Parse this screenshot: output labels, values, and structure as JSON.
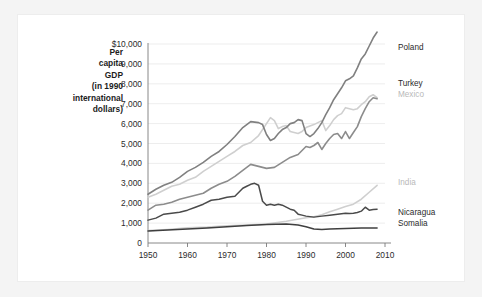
{
  "axis_title_lines": [
    "Per",
    "capita",
    "GDP",
    "(in 1990",
    "international",
    "dollars)"
  ],
  "chart_data": {
    "type": "line",
    "title": "",
    "subtitle": "",
    "xlabel": "",
    "ylabel": "Per capita GDP (in 1990 international dollars)",
    "xlim": [
      1950,
      2010
    ],
    "ylim": [
      0,
      10000
    ],
    "grid": true,
    "legend_position": "right-inline-labels",
    "ytick_labels": [
      "$10,000",
      "9,000",
      "8,000",
      "7,000",
      "6,000",
      "5,000",
      "4,000",
      "3,000",
      "2,000",
      "1,000",
      "0"
    ],
    "ytick_values": [
      10000,
      9000,
      8000,
      7000,
      6000,
      5000,
      4000,
      3000,
      2000,
      1000,
      0
    ],
    "xtick_labels": [
      "1950",
      "1960",
      "1970",
      "1980",
      "1990",
      "2000",
      "2010"
    ],
    "xtick_values": [
      1950,
      1960,
      1970,
      1980,
      1990,
      2000,
      2010
    ],
    "series": [
      {
        "name": "Poland",
        "color": "#808080",
        "width": 1.6,
        "label_y_value": 9850,
        "x": [
          1950,
          1952,
          1954,
          1956,
          1958,
          1960,
          1962,
          1964,
          1966,
          1968,
          1970,
          1972,
          1974,
          1976,
          1978,
          1979,
          1980,
          1981,
          1982,
          1983,
          1984,
          1985,
          1986,
          1987,
          1988,
          1989,
          1990,
          1991,
          1992,
          1993,
          1994,
          1995,
          1996,
          1997,
          1998,
          1999,
          2000,
          2001,
          2002,
          2003,
          2004,
          2005,
          2006,
          2007,
          2008
        ],
        "values": [
          2450,
          2700,
          2900,
          3050,
          3300,
          3600,
          3800,
          4050,
          4350,
          4600,
          4950,
          5350,
          5800,
          6100,
          6050,
          5950,
          5450,
          5150,
          5250,
          5500,
          5700,
          5800,
          6000,
          6050,
          6200,
          6150,
          5500,
          5350,
          5500,
          5750,
          6050,
          6450,
          6800,
          7200,
          7500,
          7800,
          8150,
          8250,
          8400,
          8800,
          9250,
          9500,
          9900,
          10300,
          10600
        ]
      },
      {
        "name": "Turkey",
        "color": "#8c8c8c",
        "width": 1.6,
        "label_y_value": 8050,
        "x": [
          1950,
          1952,
          1954,
          1956,
          1958,
          1960,
          1962,
          1964,
          1966,
          1968,
          1970,
          1972,
          1974,
          1976,
          1978,
          1980,
          1982,
          1984,
          1986,
          1988,
          1990,
          1991,
          1992,
          1993,
          1994,
          1995,
          1996,
          1997,
          1998,
          1999,
          2000,
          2001,
          2002,
          2003,
          2004,
          2005,
          2006,
          2007,
          2008
        ],
        "values": [
          1650,
          1900,
          1950,
          2050,
          2200,
          2300,
          2400,
          2500,
          2750,
          2950,
          3100,
          3350,
          3650,
          3950,
          3850,
          3750,
          3800,
          4050,
          4300,
          4450,
          4850,
          4800,
          4900,
          5050,
          4700,
          5000,
          5250,
          5450,
          5500,
          5250,
          5600,
          5250,
          5550,
          5850,
          6350,
          6750,
          7100,
          7300,
          7250
        ]
      },
      {
        "name": "Mexico",
        "color": "#cfcfcf",
        "width": 1.6,
        "label_y_value": 7500,
        "x": [
          1950,
          1952,
          1954,
          1956,
          1958,
          1960,
          1962,
          1964,
          1966,
          1968,
          1970,
          1972,
          1974,
          1976,
          1978,
          1980,
          1981,
          1982,
          1983,
          1984,
          1985,
          1986,
          1987,
          1988,
          1989,
          1990,
          1992,
          1994,
          1995,
          1996,
          1997,
          1998,
          1999,
          2000,
          2001,
          2002,
          2003,
          2004,
          2005,
          2006,
          2007,
          2008
        ],
        "values": [
          2300,
          2450,
          2650,
          2850,
          2950,
          3150,
          3300,
          3600,
          3850,
          4100,
          4350,
          4600,
          4900,
          5050,
          5400,
          6000,
          6300,
          6150,
          5750,
          5850,
          5900,
          5600,
          5550,
          5500,
          5600,
          5800,
          5950,
          6150,
          5650,
          5900,
          6200,
          6400,
          6500,
          6800,
          6750,
          6700,
          6750,
          6950,
          7100,
          7350,
          7450,
          7300
        ]
      },
      {
        "name": "India",
        "color": "#cfcfcf",
        "width": 1.6,
        "label_y_value": 3050,
        "x": [
          1950,
          1955,
          1960,
          1965,
          1970,
          1975,
          1980,
          1985,
          1990,
          1992,
          1994,
          1996,
          1998,
          2000,
          2002,
          2004,
          2006,
          2008
        ],
        "values": [
          620,
          680,
          760,
          800,
          870,
          900,
          950,
          1090,
          1270,
          1320,
          1420,
          1570,
          1700,
          1830,
          1950,
          2200,
          2550,
          2900
        ]
      },
      {
        "name": "Nicaragua",
        "color": "#4a4a4a",
        "width": 1.5,
        "label_y_value": 1550,
        "x": [
          1950,
          1952,
          1954,
          1956,
          1958,
          1960,
          1962,
          1964,
          1966,
          1968,
          1970,
          1972,
          1974,
          1975,
          1976,
          1977,
          1978,
          1979,
          1980,
          1981,
          1982,
          1983,
          1984,
          1985,
          1986,
          1987,
          1988,
          1989,
          1990,
          1992,
          1994,
          1996,
          1998,
          2000,
          2001,
          2002,
          2003,
          2004,
          2005,
          2006,
          2007,
          2008
        ],
        "values": [
          1150,
          1250,
          1450,
          1500,
          1550,
          1650,
          1800,
          1950,
          2150,
          2200,
          2300,
          2350,
          2750,
          2850,
          2950,
          3000,
          2900,
          2100,
          1900,
          1950,
          1900,
          1950,
          1900,
          1800,
          1700,
          1650,
          1450,
          1400,
          1350,
          1300,
          1350,
          1400,
          1450,
          1500,
          1480,
          1500,
          1530,
          1600,
          1800,
          1650,
          1680,
          1700
        ]
      },
      {
        "name": "Somalia",
        "color": "#3f3f3f",
        "width": 1.5,
        "label_y_value": 1000,
        "x": [
          1950,
          1955,
          1960,
          1965,
          1970,
          1975,
          1980,
          1985,
          1988,
          1990,
          1992,
          1994,
          1996,
          1998,
          2000,
          2002,
          2004,
          2006,
          2008
        ],
        "values": [
          600,
          650,
          700,
          760,
          820,
          880,
          930,
          950,
          900,
          820,
          700,
          680,
          700,
          720,
          730,
          740,
          750,
          760,
          760
        ]
      }
    ]
  }
}
